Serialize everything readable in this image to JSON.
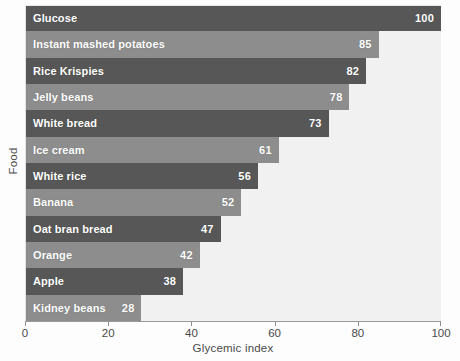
{
  "chart_data": {
    "type": "bar",
    "orientation": "horizontal",
    "title": "",
    "xlabel": "Glycemic index",
    "ylabel": "Food",
    "xlim": [
      0,
      100
    ],
    "xticks": [
      0,
      20,
      40,
      60,
      80,
      100
    ],
    "grid": false,
    "legend": false,
    "categories": [
      "Glucose",
      "Instant mashed potatoes",
      "Rice Krispies",
      "Jelly beans",
      "White bread",
      "Ice cream",
      "White rice",
      "Banana",
      "Oat bran bread",
      "Orange",
      "Apple",
      "Kidney beans"
    ],
    "values": [
      100,
      85,
      82,
      78,
      73,
      61,
      56,
      52,
      47,
      42,
      38,
      28
    ],
    "bars": [
      {
        "label": "Glucose",
        "value": 100,
        "shade": "dark"
      },
      {
        "label": "Instant mashed potatoes",
        "value": 85,
        "shade": "light"
      },
      {
        "label": "Rice Krispies",
        "value": 82,
        "shade": "dark"
      },
      {
        "label": "Jelly beans",
        "value": 78,
        "shade": "light"
      },
      {
        "label": "White bread",
        "value": 73,
        "shade": "dark"
      },
      {
        "label": "Ice cream",
        "value": 61,
        "shade": "light"
      },
      {
        "label": "White rice",
        "value": 56,
        "shade": "dark"
      },
      {
        "label": "Banana",
        "value": 52,
        "shade": "light"
      },
      {
        "label": "Oat bran bread",
        "value": 47,
        "shade": "dark"
      },
      {
        "label": "Orange",
        "value": 42,
        "shade": "light"
      },
      {
        "label": "Apple",
        "value": 38,
        "shade": "dark"
      },
      {
        "label": "Kidney beans",
        "value": 28,
        "shade": "light"
      }
    ],
    "colors": {
      "bar_dark": "#575757",
      "bar_light": "#8d8d8d",
      "plot_background": "#f1f1f1",
      "figure_background": "#fdfdfd",
      "axis": "#9a9a9a",
      "tick_text": "#4a4a4a",
      "bar_text": "#ffffff"
    }
  }
}
